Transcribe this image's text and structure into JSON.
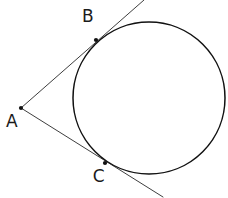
{
  "figure": {
    "background_color": "#ffffff",
    "stroke_color": "#1b1b1b",
    "circle_stroke_color": "#111111",
    "width": 228,
    "height": 198
  },
  "circle": {
    "name": "circle",
    "center_x": 149,
    "center_y": 98,
    "radius": 76
  },
  "points": [
    {
      "id": "A",
      "label": "A",
      "x": 21,
      "y": 108,
      "label_x": 12,
      "label_y": 127,
      "role": "external-vertex",
      "has_dot": true
    },
    {
      "id": "B",
      "label": "B",
      "x": 96,
      "y": 40,
      "label_x": 88,
      "label_y": 22,
      "role": "tangency-point",
      "has_dot": true
    },
    {
      "id": "C",
      "label": "C",
      "x": 105,
      "y": 163,
      "label_x": 99,
      "label_y": 182,
      "role": "tangency-point",
      "has_dot": true
    }
  ],
  "lines": [
    {
      "id": "tangent-AB",
      "label": "tangent line through A and B",
      "x1": 21,
      "y1": 108,
      "x2": 144,
      "y2": 0
    },
    {
      "id": "tangent-AC",
      "label": "tangent line through A and C",
      "x1": 21,
      "y1": 108,
      "x2": 163,
      "y2": 197
    }
  ]
}
